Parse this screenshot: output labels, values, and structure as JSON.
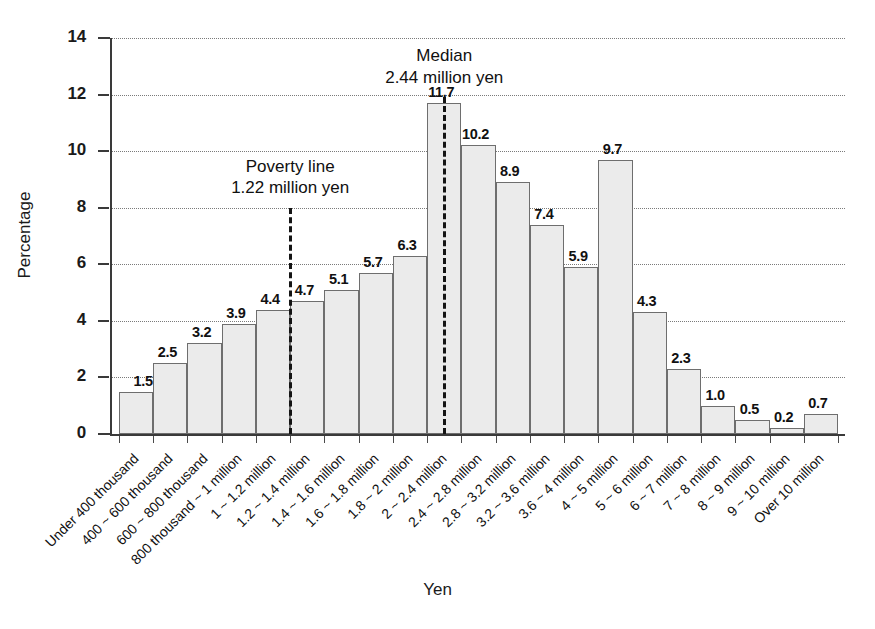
{
  "chart_data": {
    "type": "bar",
    "title": "",
    "xlabel": "Yen",
    "ylabel": "Percentage",
    "ylim": [
      0,
      14
    ],
    "ytick_labels": [
      "0",
      "2",
      "4",
      "6",
      "8",
      "10",
      "12",
      "14"
    ],
    "ytick_values": [
      0,
      2,
      4,
      6,
      8,
      10,
      12,
      14
    ],
    "grid": true,
    "legend": "none",
    "categories": [
      "Under 400 thousand",
      "400 ~ 600 thousand",
      "600 ~ 800 thousand",
      "800 thousand ~ 1 million",
      "1 ~ 1.2 million",
      "1.2 ~ 1.4 million",
      "1.4 ~ 1.6 million",
      "1.6 ~ 1.8 million",
      "1.8 ~ 2 million",
      "2 ~ 2.4 million",
      "2.4 ~ 2.8 million",
      "2.8 ~ 3.2 million",
      "3.2 ~ 3.6 million",
      "3.6 ~ 4 million",
      "4 ~ 5 million",
      "5 ~ 6 million",
      "6 ~ 7 million",
      "7 ~ 8 million",
      "8 ~ 9 million",
      "9 ~ 10 million",
      "Over 10 million"
    ],
    "values": [
      1.5,
      2.5,
      3.2,
      3.9,
      4.4,
      4.7,
      5.1,
      5.7,
      6.3,
      11.7,
      10.2,
      8.9,
      7.4,
      5.9,
      9.7,
      4.3,
      2.3,
      1.0,
      0.5,
      0.2,
      0.7
    ],
    "value_labels": [
      "1.5",
      "2.5",
      "3.2",
      "3.9",
      "4.4",
      "4.7",
      "5.1",
      "5.7",
      "6.3",
      "11.7",
      "10.2",
      "8.9",
      "7.4",
      "5.9",
      "9.7",
      "4.3",
      "2.3",
      "1.0",
      "0.5",
      "0.2",
      "0.7"
    ],
    "annotations": [
      {
        "name": "poverty-line",
        "line1": "Poverty line",
        "line2": "1.22 million yen",
        "value": 1.22,
        "unit": "million yen",
        "at_category_boundary": 5,
        "line_top_percentage": 8.0
      },
      {
        "name": "median-line",
        "line1": "Median",
        "line2": "2.44 million yen",
        "value": 2.44,
        "unit": "million yen",
        "at_category_index": 9,
        "line_top_percentage": 11.9
      }
    ],
    "colors": {
      "bar_fill": "#ebebeb",
      "bar_border": "#6e6e6e",
      "axis": "#3a3a3a",
      "gridline": "#7a7a7a",
      "annotation_line": "#141414",
      "text": "#101010"
    }
  }
}
